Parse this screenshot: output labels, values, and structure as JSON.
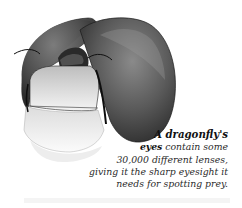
{
  "figure": {
    "colors": {
      "eye_dark": "#3a3a3a",
      "eye_mid": "#6e6e6e",
      "eye_highlight": "#a8a8a8",
      "face_light": "#d8d8d8",
      "face_pale": "#f0f0f0",
      "outline": "#111111"
    }
  },
  "caption": {
    "lead": "A dragonfly's",
    "bold_word": "eyes",
    "line2_rest": " contain some",
    "line3": "30,000 different lenses,",
    "line4": "giving it the sharp eyesight it",
    "line5": "needs for spotting prey."
  }
}
